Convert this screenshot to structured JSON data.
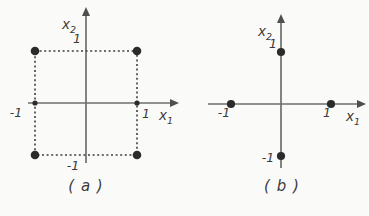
{
  "figure": {
    "background": "#fafaf8",
    "axis_color": "#6e6e6e",
    "dash_color": "#3f3f3f",
    "dot_color": "#2b2b2b",
    "text_color": "#3b3b3b",
    "arrow_color": "#4f4f4f"
  },
  "chart_data": [
    {
      "type": "scatter",
      "id": "a",
      "caption": "( a )",
      "xlabel": {
        "base": "x",
        "sub": "1"
      },
      "ylabel": {
        "base": "x",
        "sub": "2"
      },
      "x_ticks": [
        {
          "value": -1,
          "label": "-1"
        },
        {
          "value": 1,
          "label": "1"
        }
      ],
      "y_ticks": [
        {
          "value": 1,
          "label": "1"
        },
        {
          "value": -1,
          "label": "-1"
        }
      ],
      "points": [
        [
          -1,
          1
        ],
        [
          1,
          1
        ],
        [
          -1,
          -1
        ],
        [
          1,
          -1
        ]
      ],
      "small_axis_points": [
        [
          -1,
          0
        ],
        [
          1,
          0
        ]
      ],
      "dashed_square": [
        [
          -1,
          1
        ],
        [
          1,
          1
        ],
        [
          1,
          -1
        ],
        [
          -1,
          -1
        ]
      ],
      "xlim": [
        -1.6,
        1.9
      ],
      "ylim": [
        -1.3,
        2.0
      ],
      "grid": false,
      "legend": "none"
    },
    {
      "type": "scatter",
      "id": "b",
      "caption": "( b )",
      "xlabel": {
        "base": "x",
        "sub": "1"
      },
      "ylabel": {
        "base": "x",
        "sub": "2"
      },
      "x_ticks": [
        {
          "value": -1,
          "label": "-1"
        },
        {
          "value": 1,
          "label": "1"
        }
      ],
      "y_ticks": [
        {
          "value": 1,
          "label": "1"
        },
        {
          "value": -1,
          "label": "-1"
        }
      ],
      "points": [
        [
          0,
          1
        ],
        [
          -1,
          0
        ],
        [
          1,
          0
        ],
        [
          0,
          -1
        ]
      ],
      "small_axis_points": [],
      "dashed_square": [],
      "xlim": [
        -1.7,
        1.9
      ],
      "ylim": [
        -1.4,
        2.0
      ],
      "grid": false,
      "legend": "none"
    }
  ]
}
